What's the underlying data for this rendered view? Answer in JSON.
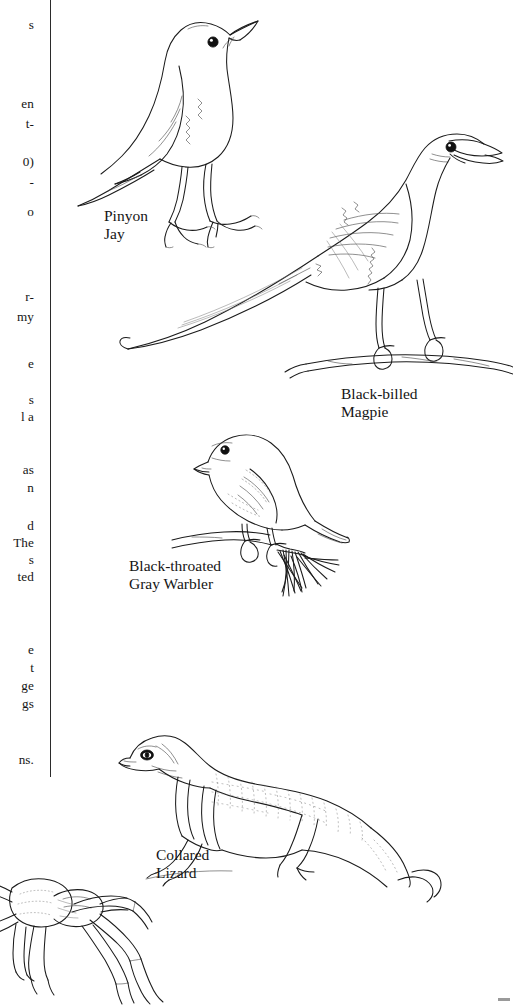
{
  "page": {
    "kind": "scanned-book-page",
    "background_color": "#ffffff",
    "ink_color": "#1b1b1b"
  },
  "text_column": {
    "description": "Body text column clipped by the left edge of the scan; only line endings are visible.",
    "fragments": [
      {
        "text": "s",
        "top": 18
      },
      {
        "text": "en",
        "top": 97
      },
      {
        "text": "t-",
        "top": 117
      },
      {
        "text": "0)",
        "top": 155
      },
      {
        "text": "-",
        "top": 175
      },
      {
        "text": "o",
        "top": 205
      },
      {
        "text": "r-",
        "top": 290
      },
      {
        "text": "my",
        "top": 310
      },
      {
        "text": "e",
        "top": 357
      },
      {
        "text": "s",
        "top": 393
      },
      {
        "text": "l a",
        "top": 410
      },
      {
        "text": "as",
        "top": 463
      },
      {
        "text": "n",
        "top": 481
      },
      {
        "text": "d",
        "top": 519
      },
      {
        "text": "The",
        "top": 536
      },
      {
        "text": "s",
        "top": 553
      },
      {
        "text": "ted",
        "top": 570
      },
      {
        "text": "e",
        "top": 643
      },
      {
        "text": "t",
        "top": 661
      },
      {
        "text": "ge",
        "top": 679
      },
      {
        "text": "gs",
        "top": 697
      },
      {
        "text": "ns.",
        "top": 753
      }
    ]
  },
  "figures": [
    {
      "id": "pinyon-jay",
      "caption": "Pinyon\nJay",
      "subject": "bird",
      "description": "Line drawing of a Pinyon Jay standing and facing upper right, long straight bill, dark round eye."
    },
    {
      "id": "black-billed-magpie",
      "caption": "Black-billed\nMagpie",
      "subject": "bird",
      "description": "Line drawing of a Black-billed Magpie perched on a branch, very long tail sweeping to the left, bill open."
    },
    {
      "id": "black-throated-gray-warbler",
      "caption": "Black-throated\nGray Warbler",
      "subject": "bird",
      "description": "Line drawing of a Black-throated Gray Warbler perched on a pine twig with a cluster of needles, facing left."
    },
    {
      "id": "collared-lizard",
      "caption": "Collared\nLizard",
      "subject": "reptile",
      "description": "Line drawing of a Collared Lizard facing left with spotted back, two dark neck bands and a long curling tail."
    },
    {
      "id": "tarantula",
      "caption": "",
      "subject": "spider",
      "description": "Partially visible line drawing of a tarantula at the lower-left edge of the page."
    }
  ]
}
